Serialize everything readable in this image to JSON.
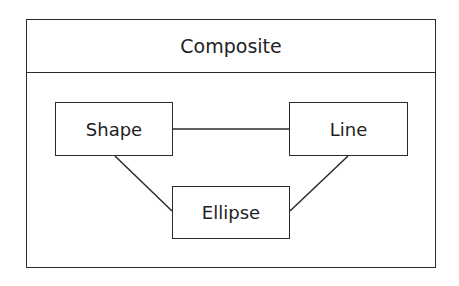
{
  "diagram": {
    "title": "Composite",
    "nodes": [
      {
        "id": "shape",
        "label": "Shape"
      },
      {
        "id": "line",
        "label": "Line"
      },
      {
        "id": "ellipse",
        "label": "Ellipse"
      }
    ],
    "edges": [
      {
        "from": "shape",
        "to": "line"
      },
      {
        "from": "shape",
        "to": "ellipse"
      },
      {
        "from": "line",
        "to": "ellipse"
      }
    ]
  }
}
